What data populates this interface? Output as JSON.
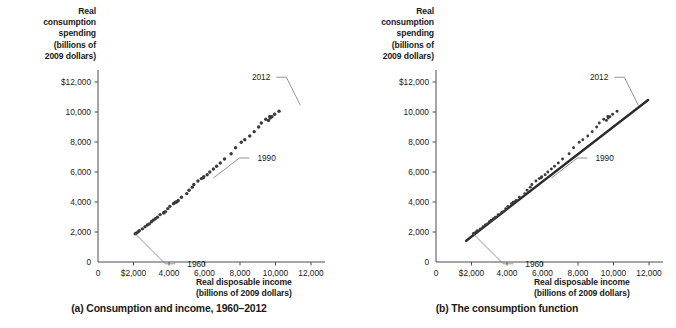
{
  "figure": {
    "panels": [
      {
        "id": "a",
        "caption": "(a) Consumption and income, 1960–2012",
        "y_axis_title": "Real\nconsumption\nspending\n(billions of\n2009 dollars)",
        "y_axis_title_lines": [
          "Real",
          "consumption",
          "spending",
          "(billions of",
          "2009 dollars)"
        ],
        "x_axis_title_lines": [
          "Real disposable income",
          "(billions of 2009 dollars)"
        ],
        "x_tick_labels": [
          "0",
          "$2,000",
          "4,000",
          "6,000",
          "8,000",
          "10,000",
          "12,000"
        ],
        "y_tick_labels": [
          "0",
          "2,000",
          "4,000",
          "6,000",
          "8,000",
          "10,000",
          "$12,000"
        ],
        "annotations": [
          {
            "label": "1960",
            "x": 2100,
            "y": 1880
          },
          {
            "label": "1990",
            "x": 6500,
            "y": 5600
          },
          {
            "label": "2012",
            "x": 11400,
            "y": 10450
          }
        ],
        "show_fit_line": false
      },
      {
        "id": "b",
        "caption": "(b) The consumption function",
        "y_axis_title_lines": [
          "Real",
          "consumption",
          "spending",
          "(billions of",
          "2009 dollars)"
        ],
        "x_axis_title_lines": [
          "Real disposable income",
          "(billions of 2009 dollars)"
        ],
        "x_tick_labels": [
          "0",
          "$2,000",
          "4,000",
          "6,000",
          "8,000",
          "10,000",
          "12,000"
        ],
        "y_tick_labels": [
          "0",
          "2,000",
          "4,000",
          "6,000",
          "8,000",
          "10,000",
          "$12,000"
        ],
        "annotations": [
          {
            "label": "1960",
            "x": 2100,
            "y": 1880
          },
          {
            "label": "1990",
            "x": 6500,
            "y": 5600
          },
          {
            "label": "2012",
            "x": 11400,
            "y": 10450
          }
        ],
        "show_fit_line": true
      }
    ],
    "colors": {
      "marker": "#3a3a3a",
      "axis": "#4d4d4d",
      "fit_line": "#2b2b2b",
      "leader": "#7a7a7a",
      "text": "#1a1a1a"
    }
  },
  "chart_data": {
    "type": "scatter",
    "title": "",
    "xlabel": "Real disposable income (billions of 2009 dollars)",
    "ylabel": "Real consumption spending (billions of 2009 dollars)",
    "xlim": [
      0,
      12000
    ],
    "ylim": [
      0,
      12000
    ],
    "xticks": [
      0,
      2000,
      4000,
      6000,
      8000,
      10000,
      12000
    ],
    "yticks": [
      0,
      2000,
      4000,
      6000,
      8000,
      10000,
      12000
    ],
    "grid": false,
    "legend": "none",
    "series": [
      {
        "name": "Consumption vs. disposable income, 1960–2012",
        "years": [
          1960,
          1961,
          1962,
          1963,
          1964,
          1965,
          1966,
          1967,
          1968,
          1969,
          1970,
          1971,
          1972,
          1973,
          1974,
          1975,
          1976,
          1977,
          1978,
          1979,
          1980,
          1981,
          1982,
          1983,
          1984,
          1985,
          1986,
          1987,
          1988,
          1989,
          1990,
          1991,
          1992,
          1993,
          1994,
          1995,
          1996,
          1997,
          1998,
          1999,
          2000,
          2001,
          2002,
          2003,
          2004,
          2005,
          2006,
          2007,
          2008,
          2009,
          2010,
          2011,
          2012
        ],
        "x": [
          2100,
          2150,
          2250,
          2330,
          2500,
          2650,
          2780,
          2890,
          3010,
          3110,
          3230,
          3350,
          3500,
          3720,
          3700,
          3800,
          3930,
          4050,
          4250,
          4350,
          4350,
          4450,
          4520,
          4700,
          5000,
          5130,
          5310,
          5400,
          5630,
          5820,
          5960,
          5930,
          6150,
          6300,
          6500,
          6680,
          6890,
          7130,
          7500,
          7750,
          8070,
          8270,
          8550,
          8800,
          9050,
          9200,
          9450,
          9680,
          9700,
          9600,
          9800,
          9950,
          10200
        ],
        "y": [
          1880,
          1920,
          2000,
          2080,
          2210,
          2350,
          2470,
          2540,
          2680,
          2790,
          2880,
          2990,
          3160,
          3300,
          3270,
          3360,
          3560,
          3710,
          3890,
          3990,
          3960,
          4020,
          4100,
          4320,
          4560,
          4780,
          4990,
          5170,
          5400,
          5560,
          5680,
          5620,
          5820,
          6000,
          6200,
          6380,
          6600,
          6870,
          7220,
          7620,
          7980,
          8150,
          8400,
          8690,
          9000,
          9270,
          9520,
          9700,
          9600,
          9440,
          9680,
          9850,
          10050
        ]
      }
    ],
    "fit_line": {
      "name": "Consumption function (panel b)",
      "x": [
        1700,
        11950
      ],
      "y": [
        1420,
        10800
      ],
      "slope": 0.915,
      "intercept": -135
    }
  }
}
